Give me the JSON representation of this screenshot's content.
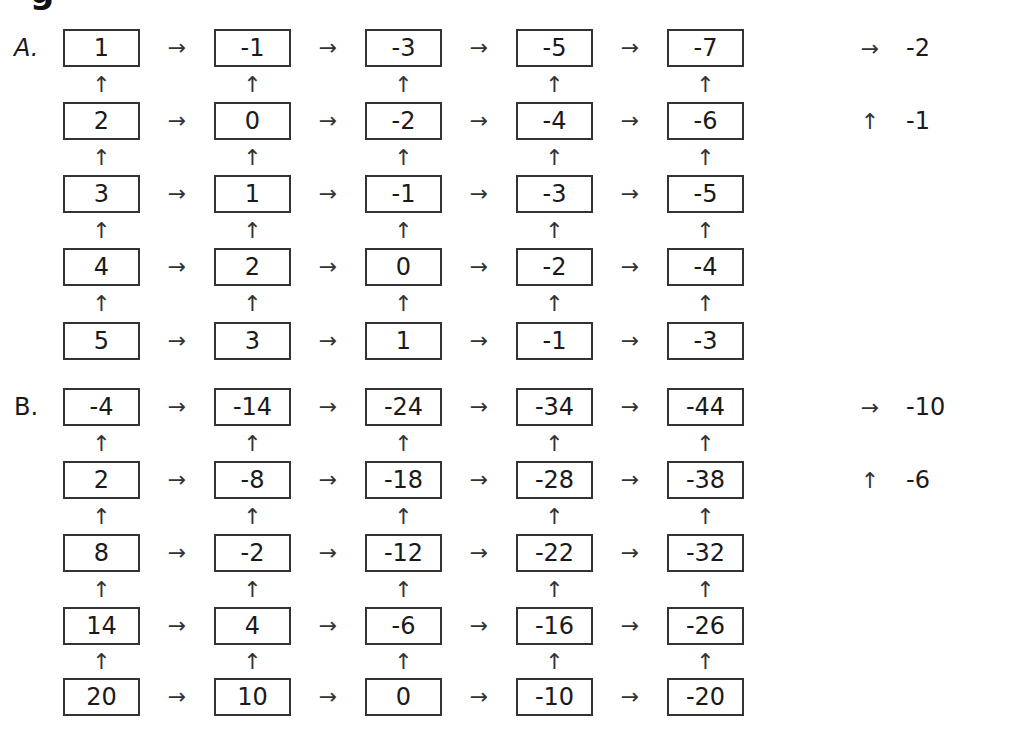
{
  "title_fragment": "g",
  "layout": {
    "col_left": [
      63,
      214,
      365,
      516,
      667
    ],
    "cell_width": 77,
    "cell_height": 38
  },
  "sections": [
    {
      "label": "A.",
      "top": 29,
      "row_tops": [
        0,
        73,
        146,
        219,
        293
      ],
      "rows": [
        [
          "1",
          "-1",
          "-3",
          "-5",
          "-7"
        ],
        [
          "2",
          "0",
          "-2",
          "-4",
          "-6"
        ],
        [
          "3",
          "1",
          "-1",
          "-3",
          "-5"
        ],
        [
          "4",
          "2",
          "0",
          "-2",
          "-4"
        ],
        [
          "5",
          "3",
          "1",
          "-1",
          "-3"
        ]
      ],
      "rules": [
        {
          "symbol": "→",
          "value": "-2",
          "name": "right-rule"
        },
        {
          "symbol": "↑",
          "value": "-1",
          "name": "up-rule"
        }
      ]
    },
    {
      "label": "B.",
      "top": 388,
      "row_tops": [
        0,
        73,
        146,
        219,
        290
      ],
      "rows": [
        [
          "-4",
          "-14",
          "-24",
          "-34",
          "-44"
        ],
        [
          "2",
          "-8",
          "-18",
          "-28",
          "-38"
        ],
        [
          "8",
          "-2",
          "-12",
          "-22",
          "-32"
        ],
        [
          "14",
          "4",
          "-6",
          "-16",
          "-26"
        ],
        [
          "20",
          "10",
          "0",
          "-10",
          "-20"
        ]
      ],
      "rules": [
        {
          "symbol": "→",
          "value": "-10",
          "name": "right-rule"
        },
        {
          "symbol": "↑",
          "value": "-6",
          "name": "up-rule"
        }
      ]
    }
  ],
  "glyphs": {
    "arrow_right": "→",
    "arrow_up": "↑"
  }
}
